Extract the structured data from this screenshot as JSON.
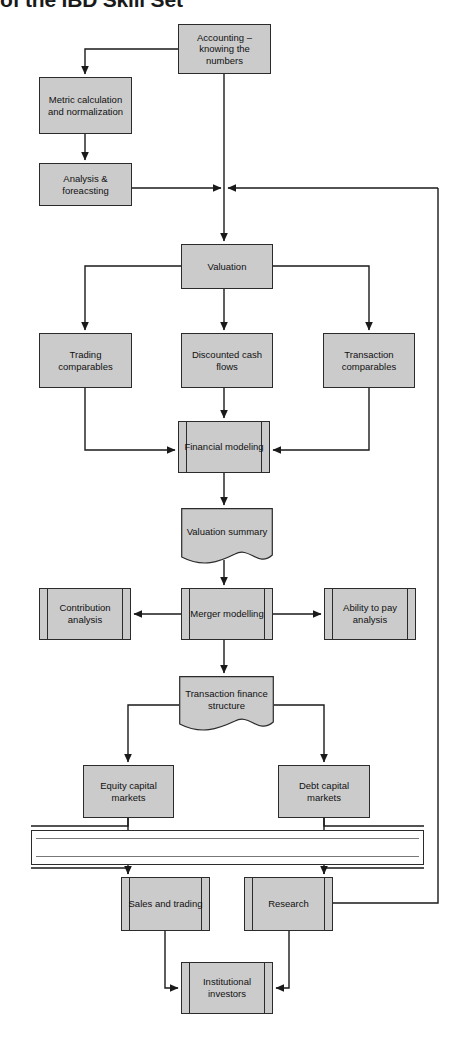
{
  "title": "of the IBD Skill Set",
  "diagram": {
    "type": "flowchart",
    "fill_color": "#cbcbcb",
    "stroke_color": "#2b2b2b",
    "background": "#ffffff",
    "nodes": [
      {
        "id": "accounting",
        "label": "Accounting – knowing the numbers",
        "shape": "process",
        "x": 178,
        "y": 24,
        "w": 93,
        "h": 50
      },
      {
        "id": "metric",
        "label": "Metric calculation and normalization",
        "shape": "process",
        "x": 39,
        "y": 77,
        "w": 93,
        "h": 57
      },
      {
        "id": "analysis",
        "label": "Analysis & foreacsting",
        "shape": "process",
        "x": 39,
        "y": 163,
        "w": 93,
        "h": 43
      },
      {
        "id": "valuation",
        "label": "Valuation",
        "shape": "process",
        "x": 181,
        "y": 244,
        "w": 92,
        "h": 45
      },
      {
        "id": "trading",
        "label": "Trading comparables",
        "shape": "process",
        "x": 39,
        "y": 333,
        "w": 93,
        "h": 55
      },
      {
        "id": "dcf",
        "label": "Discounted cash flows",
        "shape": "process",
        "x": 181,
        "y": 333,
        "w": 92,
        "h": 55
      },
      {
        "id": "transaction",
        "label": "Transaction comparables",
        "shape": "process",
        "x": 323,
        "y": 333,
        "w": 92,
        "h": 55
      },
      {
        "id": "finmodel",
        "label": "Financial modeling",
        "shape": "predefined-process",
        "x": 178,
        "y": 421,
        "w": 92,
        "h": 52
      },
      {
        "id": "valsummary",
        "label": "Valuation summary",
        "shape": "document",
        "x": 181,
        "y": 508,
        "w": 92,
        "h": 58
      },
      {
        "id": "contribution",
        "label": "Contribution analysis",
        "shape": "predefined-process",
        "x": 39,
        "y": 588,
        "w": 92,
        "h": 52
      },
      {
        "id": "merger",
        "label": "Merger modelling",
        "shape": "predefined-process",
        "x": 181,
        "y": 588,
        "w": 92,
        "h": 52
      },
      {
        "id": "abilitypay",
        "label": "Ability to pay analysis",
        "shape": "predefined-process",
        "x": 324,
        "y": 588,
        "w": 92,
        "h": 52
      },
      {
        "id": "txfinance",
        "label": "Transaction finance structure",
        "shape": "document",
        "x": 179,
        "y": 676,
        "w": 95,
        "h": 57
      },
      {
        "id": "ecm",
        "label": "Equity capital markets",
        "shape": "process",
        "x": 83,
        "y": 765,
        "w": 91,
        "h": 53
      },
      {
        "id": "dcm",
        "label": "Debt capital markets",
        "shape": "process",
        "x": 278,
        "y": 765,
        "w": 92,
        "h": 53
      },
      {
        "id": "salestrading",
        "label": "Sales and trading",
        "shape": "predefined-process",
        "x": 121,
        "y": 877,
        "w": 89,
        "h": 54
      },
      {
        "id": "research",
        "label": "Research",
        "shape": "predefined-process",
        "x": 244,
        "y": 877,
        "w": 89,
        "h": 54
      },
      {
        "id": "institutional",
        "label": "Institutional investors",
        "shape": "predefined-process",
        "x": 181,
        "y": 962,
        "w": 92,
        "h": 52
      }
    ],
    "chinese_wall": {
      "x": 31,
      "y": 830,
      "w": 393,
      "h": 35
    },
    "edges": [
      {
        "from": "accounting",
        "to": "metric",
        "note": "left then down"
      },
      {
        "from": "metric",
        "to": "analysis",
        "note": "down"
      },
      {
        "from": "analysis",
        "to": "junction",
        "note": "right into trunk"
      },
      {
        "from": "accounting",
        "to": "valuation",
        "note": "down trunk"
      },
      {
        "from": "valuation",
        "to": "trading",
        "note": "left then down"
      },
      {
        "from": "valuation",
        "to": "dcf",
        "note": "down"
      },
      {
        "from": "valuation",
        "to": "transaction",
        "note": "right then down"
      },
      {
        "from": "trading",
        "to": "finmodel",
        "note": "down then right"
      },
      {
        "from": "dcf",
        "to": "finmodel",
        "note": "down"
      },
      {
        "from": "transaction",
        "to": "finmodel",
        "note": "down then left"
      },
      {
        "from": "finmodel",
        "to": "valsummary",
        "note": "down"
      },
      {
        "from": "valsummary",
        "to": "merger",
        "note": "down"
      },
      {
        "from": "merger",
        "to": "contribution",
        "note": "left"
      },
      {
        "from": "merger",
        "to": "abilitypay",
        "note": "right"
      },
      {
        "from": "merger",
        "to": "txfinance",
        "note": "down"
      },
      {
        "from": "txfinance",
        "to": "ecm",
        "note": "left then down"
      },
      {
        "from": "txfinance",
        "to": "dcm",
        "note": "right then down"
      },
      {
        "from": "ecm",
        "to": "salestrading",
        "note": "down through wall"
      },
      {
        "from": "dcm",
        "to": "research",
        "note": "down through wall"
      },
      {
        "from": "salestrading",
        "to": "institutional",
        "note": "down then right"
      },
      {
        "from": "research",
        "to": "institutional",
        "note": "down then left"
      },
      {
        "from": "research",
        "to": "junction",
        "note": "feedback right edge up to valuation trunk"
      }
    ]
  }
}
